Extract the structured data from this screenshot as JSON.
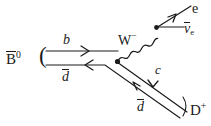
{
  "figure": {
    "kind": "feynman-diagram",
    "process": "B0bar -> D+ e nubar_e",
    "background_color": "#ffffff",
    "line_color": "#1b1b1b",
    "text_color": "#1b1b1b"
  },
  "labels": {
    "initial_meson": "B",
    "initial_meson_charge": "0",
    "open_paren": "(",
    "quark_b": "b",
    "antiquark_d_top": "d",
    "boson_w": "W",
    "boson_w_charge": "−",
    "lepton_e": "e",
    "antineutrino": "ν",
    "antineutrino_sub": "e",
    "quark_c": "c",
    "antiquark_d_bottom": "d",
    "close_paren": ")",
    "final_meson": "D",
    "final_meson_charge": "+"
  },
  "vertices": {
    "weak_vertex": {
      "x": 117,
      "y": 62,
      "name": "b-to-c-W-vertex"
    },
    "lepton_vertex": {
      "x": 157,
      "y": 27,
      "name": "W-to-lepton-vertex"
    }
  },
  "lines": [
    {
      "name": "b-quark-line",
      "from": [
        46,
        51
      ],
      "to": [
        117,
        51
      ],
      "arrow": "right"
    },
    {
      "name": "antid-top-line",
      "from": [
        46,
        65
      ],
      "to": [
        110,
        65
      ],
      "arrow": "left"
    },
    {
      "name": "c-quark-line",
      "from": [
        117,
        62
      ],
      "to": [
        186,
        111
      ],
      "arrow": "down-right"
    },
    {
      "name": "antid-bottom-line",
      "from": [
        106,
        72
      ],
      "to": [
        180,
        118
      ],
      "arrow": "up-left"
    },
    {
      "name": "w-boson-wavy-line",
      "from": [
        117,
        62
      ],
      "to": [
        157,
        27
      ],
      "style": "wavy"
    },
    {
      "name": "electron-line",
      "from": [
        157,
        27
      ],
      "to": [
        190,
        6
      ],
      "arrow": "up-right"
    },
    {
      "name": "antineutrino-line",
      "from": [
        157,
        27
      ],
      "to": [
        184,
        27
      ],
      "arrow": "none"
    }
  ]
}
